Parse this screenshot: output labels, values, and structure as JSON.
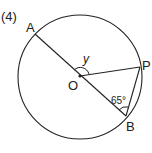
{
  "problem_number": "(4)",
  "points": {
    "A": "A",
    "O": "O",
    "P": "P",
    "B": "B"
  },
  "angles": {
    "y_label": "y",
    "angle_OBP": "65°"
  },
  "colors": {
    "stroke": "#222222",
    "background": "#ffffff"
  }
}
